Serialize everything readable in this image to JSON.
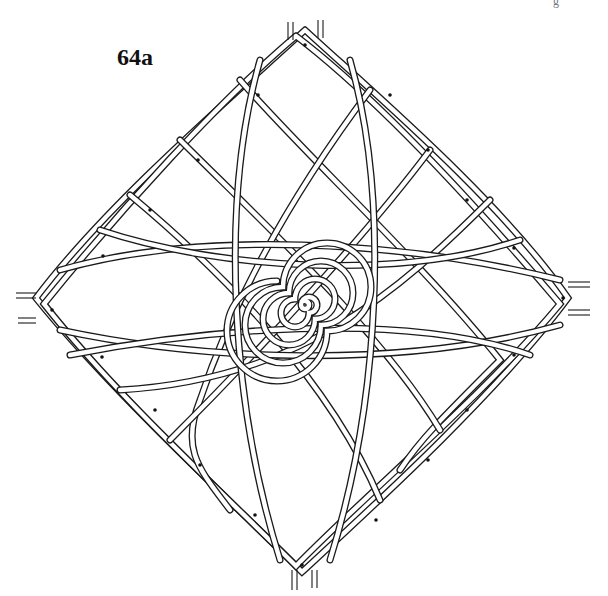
{
  "figure": {
    "label": "64a",
    "corner_mark": "g",
    "colors": {
      "line": "#1a1a1a",
      "background": "#ffffff"
    }
  },
  "nodes": {
    "top": [
      305,
      30
    ],
    "right": [
      568,
      298
    ],
    "bottom": [
      302,
      572
    ],
    "left": [
      36,
      298
    ],
    "center": [
      305,
      305
    ]
  }
}
